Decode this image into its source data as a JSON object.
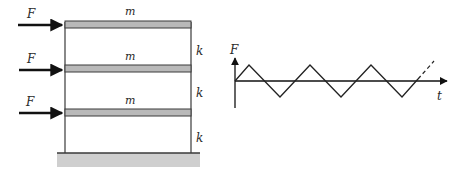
{
  "frame": {
    "mass_label": "m",
    "force_label": "F",
    "stiffness_label": "k",
    "floors": [
      {
        "mass": "m",
        "force": "F",
        "stiffness": "k"
      },
      {
        "mass": "m",
        "force": "F",
        "stiffness": "k"
      },
      {
        "mass": "m",
        "force": "F",
        "stiffness": "k"
      }
    ],
    "colors": {
      "slab_fill": "#b9b9b9",
      "line": "#3a3a3a",
      "ground_fill": "#cfcfcf"
    }
  },
  "load_graph": {
    "y_axis_label": "F",
    "x_axis_label": "t",
    "waveform": "triangular",
    "continues": true
  }
}
